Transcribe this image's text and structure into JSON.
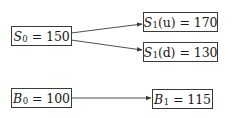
{
  "diagram": {
    "title": "",
    "nodes": {
      "s0": {
        "var": "S",
        "sub": "0",
        "arg": "",
        "value": "150"
      },
      "s1u": {
        "var": "S",
        "sub": "1",
        "arg": "(u)",
        "value": "170"
      },
      "s1d": {
        "var": "S",
        "sub": "1",
        "arg": "(d)",
        "value": "130"
      },
      "b0": {
        "var": "B",
        "sub": "0",
        "arg": "",
        "value": "100"
      },
      "b1": {
        "var": "B",
        "sub": "1",
        "arg": "",
        "value": "115"
      }
    },
    "equals": "=",
    "edges": [
      {
        "from": "s0",
        "to": "s1u"
      },
      {
        "from": "s0",
        "to": "s1d"
      },
      {
        "from": "b0",
        "to": "b1"
      }
    ],
    "colors": {
      "line": "#3a3a3a",
      "text": "#1a1a1a",
      "background": "#ffffff"
    }
  }
}
